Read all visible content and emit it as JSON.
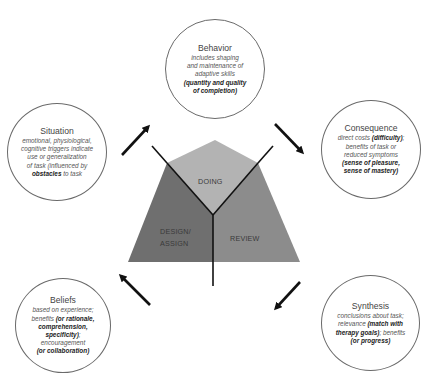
{
  "triangle": {
    "sections": [
      {
        "id": "doing",
        "label": "DOING",
        "color": "#b3b3b3"
      },
      {
        "id": "design",
        "label_line1": "DESIGN/",
        "label_line2": "ASSIGN",
        "color": "#6f6f6f"
      },
      {
        "id": "review",
        "label": "REVIEW",
        "color": "#8c8c8c"
      }
    ]
  },
  "nodes": {
    "behavior": {
      "title": "Behavior",
      "lines": [
        "includes shaping",
        "and maintenance of",
        "adaptive skills"
      ],
      "bold_lines": [
        "(quantity and quality",
        "of completion)"
      ]
    },
    "consequence": {
      "title": "Consequence",
      "line1_pre": "direct costs ",
      "line1_bold": "(difficulty)",
      "line1_post": ";",
      "lines": [
        "benefits of task or",
        "reduced symptoms"
      ],
      "bold_lines": [
        "(sense of pleasure,",
        "sense of mastery)"
      ]
    },
    "synthesis": {
      "title": "Synthesis",
      "line1": "conclusions about task;",
      "line2_pre": "relevance ",
      "line2_bold": "(match with",
      "line3_bold": "therapy goals)",
      "line3_post": "; benefits",
      "line4_bold": "(or progress)"
    },
    "beliefs": {
      "title": "Beliefs",
      "line1": "based on experience;",
      "line2_pre": "benefits ",
      "line2_bold": "(or rationale,",
      "line3_bold": "comprehension,",
      "line4_bold": "specificity)",
      "line4_post": ";",
      "line5": "encouragement",
      "line6_bold": "(or collaboration)"
    },
    "situation": {
      "title": "Situation",
      "lines": [
        "emotional, physiological,",
        "cognitive triggers indicate",
        "use or generalization",
        "of task (influenced by"
      ],
      "last_bold": "obstacles",
      "last_post": " to task"
    }
  },
  "arrows": [
    {
      "id": "situation-to-behavior",
      "direction": "up-right"
    },
    {
      "id": "behavior-to-consequence",
      "direction": "down-right"
    },
    {
      "id": "consequence-to-synthesis",
      "direction": "down-left"
    },
    {
      "id": "synthesis-to-beliefs",
      "direction": "up-left"
    }
  ]
}
